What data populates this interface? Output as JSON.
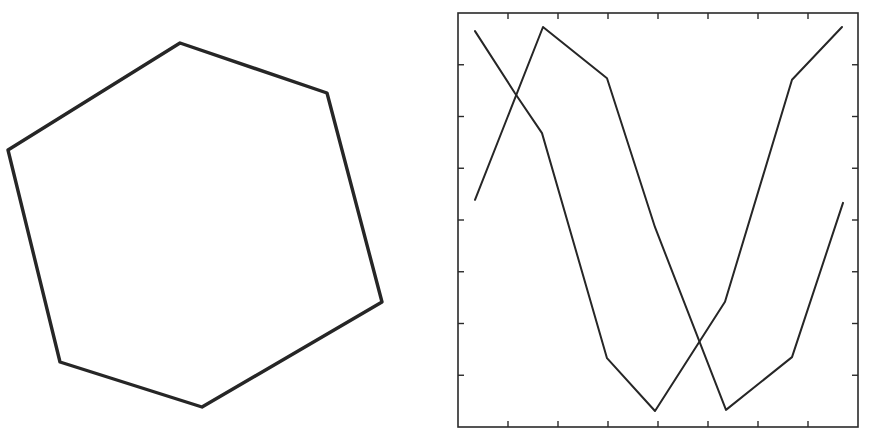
{
  "figure": {
    "panels": [
      {
        "id": "hexagon",
        "kind": "shape",
        "shape": "hexagon",
        "vertices": [
          [
            180,
            43
          ],
          [
            327,
            93
          ],
          [
            382,
            302
          ],
          [
            202,
            407
          ],
          [
            60,
            362
          ],
          [
            8,
            150
          ]
        ],
        "stroke_color": "#262626"
      },
      {
        "id": "line-plot",
        "kind": "chart"
      }
    ],
    "frame": {
      "left": 458,
      "top": 13,
      "right": 858,
      "bottom": 427
    },
    "ink_color": "#262626",
    "background": "#ffffff"
  },
  "chart_data": {
    "type": "line",
    "title": "",
    "xlabel": "",
    "ylabel": "",
    "xlim": [
      0,
      8
    ],
    "ylim": [
      0,
      8
    ],
    "x_ticks": [
      1,
      2,
      3,
      4,
      5,
      6,
      7
    ],
    "y_ticks": [
      1,
      2,
      3,
      4,
      5,
      6,
      7
    ],
    "x_tick_labels": [],
    "y_tick_labels": [],
    "grid": false,
    "legend": null,
    "series": [
      {
        "name": "curve-a",
        "x": [
          0.34,
          1.14,
          1.68,
          2.98,
          3.94,
          5.34,
          6.68,
          7.68
        ],
        "y": [
          7.65,
          6.45,
          5.68,
          1.33,
          0.31,
          2.42,
          6.71,
          7.73
        ]
      },
      {
        "name": "curve-b",
        "x": [
          0.34,
          1.7,
          2.98,
          3.94,
          5.36,
          6.68,
          7.7
        ],
        "y": [
          4.39,
          7.73,
          6.74,
          3.86,
          0.33,
          1.35,
          4.33
        ]
      }
    ]
  }
}
